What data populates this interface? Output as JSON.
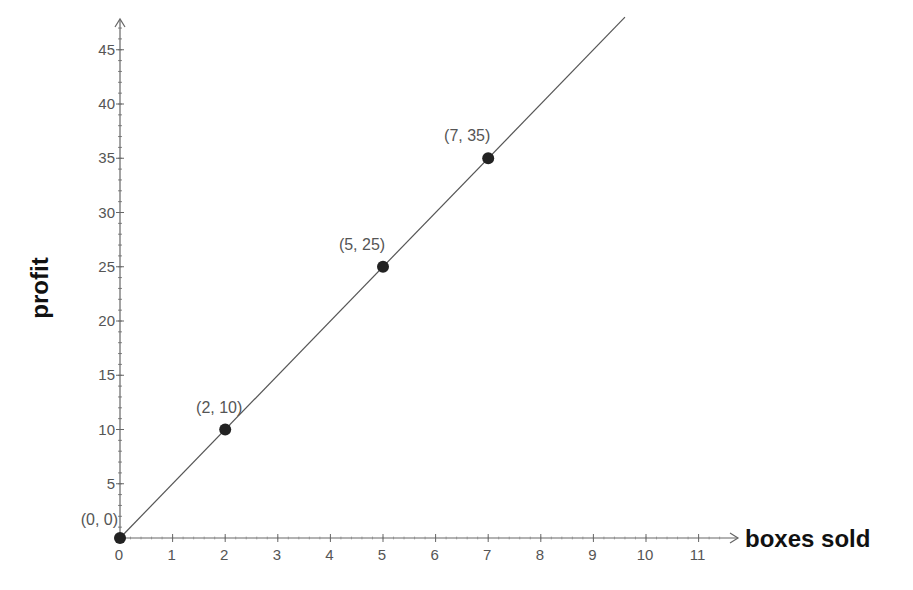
{
  "chart_data": {
    "type": "line",
    "title": "",
    "xlabel": "boxes sold",
    "ylabel": "profit",
    "xlim": [
      0,
      11.5
    ],
    "ylim": [
      0,
      47
    ],
    "x_ticks": [
      0,
      1,
      2,
      3,
      4,
      5,
      6,
      7,
      8,
      9,
      10,
      11
    ],
    "y_ticks": [
      5,
      10,
      15,
      20,
      25,
      30,
      35,
      40,
      45
    ],
    "x_tick_labels": [
      "0",
      "1",
      "2",
      "3",
      "4",
      "5",
      "6",
      "7",
      "8",
      "9",
      "10",
      "11"
    ],
    "y_tick_labels": [
      "5",
      "10",
      "15",
      "20",
      "25",
      "30",
      "35",
      "40",
      "45"
    ],
    "grid": false,
    "legend": null,
    "series": [
      {
        "name": "profit = 5 × boxes sold",
        "line": {
          "x": [
            0,
            9.6
          ],
          "y": [
            0,
            48
          ]
        },
        "points": [
          {
            "x": 0,
            "y": 0,
            "label": "(0, 0)"
          },
          {
            "x": 2,
            "y": 10,
            "label": "(2, 10)"
          },
          {
            "x": 5,
            "y": 25,
            "label": "(5, 25)"
          },
          {
            "x": 7,
            "y": 35,
            "label": "(7, 35)"
          }
        ]
      }
    ],
    "annotations": [
      "(0, 0)",
      "(2, 10)",
      "(5, 25)",
      "(7, 35)"
    ]
  },
  "colors": {
    "line": "#555555",
    "point": "#222222",
    "axis": "#666666",
    "text": "#555555",
    "title_text": "#111111"
  }
}
